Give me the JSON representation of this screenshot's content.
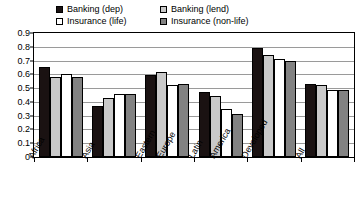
{
  "chart_data": {
    "type": "bar",
    "title": "",
    "subtitle": "",
    "xlabel": "",
    "ylabel": "",
    "ylim": [
      0,
      0.9
    ],
    "grid": true,
    "legend_position": "top",
    "ytick_labels": [
      "0.9",
      "0.8",
      "0.7",
      "0.6",
      "0.5",
      "0.4",
      "0.3",
      "0.2",
      "0.1",
      "0"
    ],
    "ytick_values": [
      0.9,
      0.8,
      0.7,
      0.6,
      0.5,
      0.4,
      0.3,
      0.2,
      0.1,
      0
    ],
    "categories": [
      "Africa",
      "Asia",
      "Eastern Europe",
      "Latin America",
      "Developed",
      "All"
    ],
    "category_lines": [
      [
        "Africa"
      ],
      [
        "Asia"
      ],
      [
        "Eastern",
        "Europe"
      ],
      [
        "Latin",
        "America"
      ],
      [
        "Developed"
      ],
      [
        "All"
      ]
    ],
    "series": [
      {
        "name": "Banking (dep)",
        "color": "#1a1212",
        "values": [
          0.65,
          0.37,
          0.595,
          0.475,
          0.79,
          0.53
        ]
      },
      {
        "name": "Banking (lend)",
        "color": "#c9c9c9",
        "values": [
          0.58,
          0.43,
          0.62,
          0.445,
          0.74,
          0.525
        ]
      },
      {
        "name": "Insurance (life)",
        "color": "#ffffff",
        "values": [
          0.6,
          0.455,
          0.52,
          0.345,
          0.71,
          0.49
        ]
      },
      {
        "name": "Insurance (non-life)",
        "color": "#828282",
        "values": [
          0.58,
          0.46,
          0.53,
          0.31,
          0.695,
          0.485
        ]
      }
    ]
  },
  "legend": {
    "entries": [
      {
        "label": "Banking (dep)",
        "color": "#1a1212"
      },
      {
        "label": "Banking (lend)",
        "color": "#c9c9c9"
      },
      {
        "label": "Insurance (life)",
        "color": "#ffffff"
      },
      {
        "label": "Insurance (non-life)",
        "color": "#828282"
      }
    ]
  }
}
